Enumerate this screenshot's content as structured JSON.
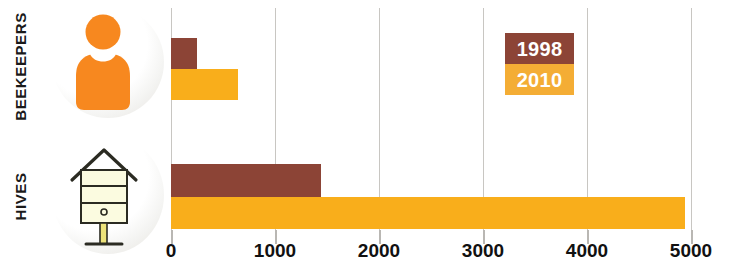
{
  "chart_data": {
    "type": "bar",
    "orientation": "horizontal",
    "title": "",
    "xlabel": "",
    "ylabel": "",
    "categories": [
      "BEEKEEPERS",
      "HIVES"
    ],
    "series": [
      {
        "name": "1998",
        "color": "#8c4436",
        "values": [
          250,
          1440
        ]
      },
      {
        "name": "2010",
        "color": "#f9ae1b",
        "values": [
          640,
          4940
        ]
      }
    ],
    "xlim": [
      0,
      5000
    ],
    "xticks": [
      0,
      1000,
      2000,
      3000,
      4000,
      5000
    ],
    "xtick_labels": [
      "0",
      "1000",
      "2000",
      "3000",
      "4000",
      "5000"
    ],
    "grid": true,
    "legend_position": "upper-right"
  },
  "categories": {
    "beekeepers": {
      "label": "BEEKEEPERS",
      "icon": "person-icon",
      "bars": [
        {
          "series": "1998",
          "value": 250,
          "color": "#8c4436"
        },
        {
          "series": "2010",
          "value": 640,
          "color": "#f9ae1b"
        }
      ]
    },
    "hives": {
      "label": "HIVES",
      "icon": "beehive-icon",
      "bars": [
        {
          "series": "1998",
          "value": 1440,
          "color": "#8c4436"
        },
        {
          "series": "2010",
          "value": 4940,
          "color": "#f9ae1b"
        }
      ]
    }
  },
  "legend": {
    "items": [
      {
        "label": "1998",
        "color": "#8c4436",
        "text_color": "#ffffff"
      },
      {
        "label": "2010",
        "color": "#f4ad35",
        "text_color": "#ffffff"
      }
    ]
  },
  "axis": {
    "ticks": [
      {
        "label": "0",
        "value": 0
      },
      {
        "label": "1000",
        "value": 1000
      },
      {
        "label": "2000",
        "value": 2000
      },
      {
        "label": "3000",
        "value": 3000
      },
      {
        "label": "4000",
        "value": 4000
      },
      {
        "label": "5000",
        "value": 5000
      }
    ]
  },
  "colors": {
    "series_1998": "#8c4436",
    "series_2010": "#f9ae1b",
    "gridline": "#c8c6c2",
    "text": "#111111",
    "background": "#ffffff"
  }
}
